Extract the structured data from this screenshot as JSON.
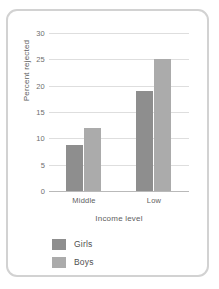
{
  "card": {
    "border_color": "#d2d2d2",
    "background": "#ffffff"
  },
  "chart_data": {
    "type": "bar",
    "title": "",
    "xlabel": "Income level",
    "ylabel": "Percent rejected",
    "categories": [
      "Middle",
      "Low"
    ],
    "series": [
      {
        "name": "Girls",
        "color": "#8e8e8e",
        "values": [
          8.7,
          19
        ]
      },
      {
        "name": "Boys",
        "color": "#ababab",
        "values": [
          12,
          25
        ]
      }
    ],
    "ylim": [
      0,
      30
    ],
    "yticks": [
      0,
      5,
      10,
      15,
      20,
      25,
      30
    ],
    "ytick_labels": [
      "0",
      "5",
      "10",
      "15",
      "20",
      "25",
      "30"
    ],
    "grid": true,
    "grid_color": "#dedede",
    "legend_position": "below-left",
    "legend_entries": [
      "Girls",
      "Boys"
    ]
  }
}
